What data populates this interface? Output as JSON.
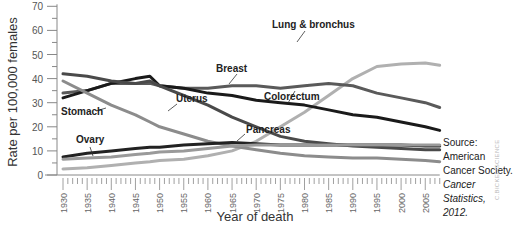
{
  "chart_data": {
    "type": "line",
    "title": "",
    "xlabel": "Year of death",
    "ylabel": "Rate per 100,000 females",
    "ylim": [
      0,
      70
    ],
    "xlim": [
      1930,
      2008
    ],
    "yticks": [
      0,
      10,
      20,
      30,
      40,
      50,
      60,
      70
    ],
    "xticks": [
      1930,
      1935,
      1940,
      1945,
      1950,
      1955,
      1960,
      1965,
      1970,
      1975,
      1980,
      1985,
      1990,
      1995,
      2000,
      2005
    ],
    "grid": false,
    "legend": "inline labels",
    "x": [
      1930,
      1935,
      1940,
      1945,
      1948,
      1950,
      1955,
      1960,
      1965,
      1970,
      1975,
      1980,
      1985,
      1990,
      1995,
      2000,
      2005,
      2008
    ],
    "series": [
      {
        "name": "Lung & bronchus",
        "color": "#b0b0b0",
        "values": [
          2.5,
          3,
          4,
          5,
          5.5,
          6,
          6.5,
          8,
          10,
          14,
          20,
          26,
          33,
          40,
          45,
          46,
          46.5,
          45.5
        ]
      },
      {
        "name": "Breast",
        "color": "#5a5a5a",
        "values": [
          34,
          35,
          38,
          38,
          38,
          37,
          36,
          36,
          37,
          37,
          36,
          37,
          38,
          37,
          34,
          32,
          30,
          28
        ]
      },
      {
        "name": "Colorectum",
        "color": "#1a1a1a",
        "values": [
          32,
          35,
          38,
          40,
          41,
          37,
          36,
          34,
          33,
          31,
          30,
          29,
          27,
          25,
          24,
          22,
          20,
          18.5
        ]
      },
      {
        "name": "Uterus",
        "color": "#4a4a4a",
        "values": [
          42,
          41,
          39,
          38,
          39,
          37,
          33,
          29,
          24,
          20,
          16,
          14,
          13,
          12,
          11.5,
          11,
          10.5,
          10.5
        ]
      },
      {
        "name": "Stomach",
        "color": "#8c8c8c",
        "values": [
          39,
          34,
          29,
          25,
          22,
          20,
          17,
          14,
          12,
          10.5,
          9,
          8,
          7.5,
          7,
          7,
          6.5,
          6,
          5.5
        ]
      },
      {
        "name": "Ovary",
        "color": "#222222",
        "values": [
          7.5,
          9,
          10,
          11,
          11.5,
          11.5,
          12.5,
          13,
          13.5,
          13,
          12.5,
          12.5,
          12.5,
          12.5,
          12.5,
          12.5,
          12,
          12
        ]
      },
      {
        "name": "Pancreas",
        "color": "#9a9a9a",
        "values": [
          6.5,
          7,
          7.5,
          8.5,
          9,
          9.5,
          10,
          11,
          12,
          12.5,
          12.5,
          12.5,
          12.5,
          12.5,
          12.5,
          12.5,
          12.5,
          12.5
        ]
      }
    ],
    "annotations": [
      "Lung & bronchus",
      "Breast",
      "Colorectum",
      "Uterus",
      "Stomach",
      "Ovary",
      "Pancreas"
    ]
  },
  "labels": {
    "lung": "Lung & bronchus",
    "breast": "Breast",
    "colorectum": "Colorectum",
    "uterus": "Uterus",
    "stomach": "Stomach",
    "ovary": "Ovary",
    "pancreas": "Pancreas"
  },
  "source": {
    "line1": "Source: American",
    "line2": "Cancer Society.",
    "line3": "Cancer Statistics,",
    "line4": "2012."
  },
  "credit": "C.BICKEL/SCIENCE"
}
